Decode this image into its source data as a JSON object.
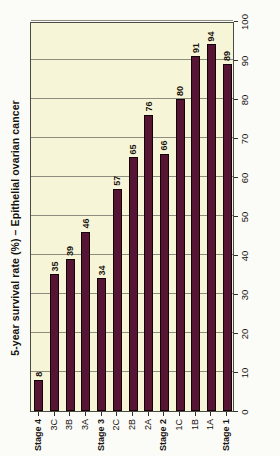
{
  "chart_data": {
    "type": "bar",
    "orientation": "horizontal",
    "title": "5-year survival rate (%) – Epithelial ovarian cancer",
    "xlabel": "",
    "ylabel": "",
    "xlim": [
      0,
      100
    ],
    "xticks": [
      0,
      10,
      20,
      30,
      40,
      50,
      60,
      70,
      80,
      90,
      100
    ],
    "xtick_labels": [
      "0",
      "10",
      "20",
      "30",
      "40",
      "50",
      "60",
      "70",
      "80",
      "90",
      "100"
    ],
    "grid": true,
    "grid_axis": "x",
    "legend": "none",
    "categories": [
      "Stage 1",
      "1A",
      "1B",
      "1C",
      "Stage 2",
      "2A",
      "2B",
      "2C",
      "Stage 3",
      "3A",
      "3B",
      "3C",
      "Stage 4"
    ],
    "values": [
      89,
      94,
      91,
      80,
      66,
      76,
      65,
      57,
      34,
      46,
      39,
      35,
      8
    ],
    "data_labels": [
      "89",
      "94",
      "91",
      "80",
      "66",
      "76",
      "65",
      "57",
      "34",
      "46",
      "39",
      "35",
      "8"
    ],
    "bar_color": "#571534",
    "bar_edge_color": "#130208",
    "plot_background": "#f7f5d8",
    "axis_color": "#4a4a44",
    "gridline_color": "#8d8d7e"
  },
  "figure": {
    "rotation_note": "image is rotated 90 degrees counter-clockwise"
  }
}
